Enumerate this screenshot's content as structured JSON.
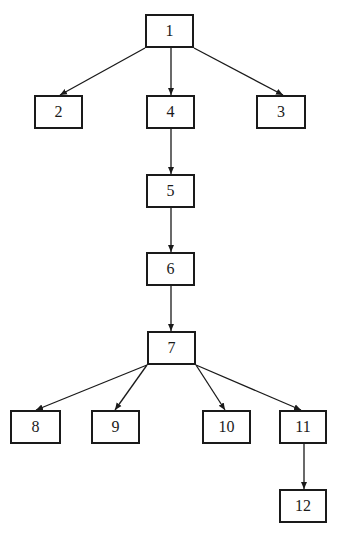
{
  "diagram": {
    "type": "tree",
    "colors": {
      "stroke": "#1a1a1a",
      "background": "#ffffff"
    },
    "nodes": [
      {
        "id": "1",
        "label": "1",
        "x": 145,
        "y": 14,
        "w": 49,
        "h": 34
      },
      {
        "id": "2",
        "label": "2",
        "x": 34,
        "y": 95,
        "w": 49,
        "h": 34
      },
      {
        "id": "4",
        "label": "4",
        "x": 146,
        "y": 95,
        "w": 49,
        "h": 34
      },
      {
        "id": "3",
        "label": "3",
        "x": 256,
        "y": 95,
        "w": 50,
        "h": 34
      },
      {
        "id": "5",
        "label": "5",
        "x": 146,
        "y": 174,
        "w": 49,
        "h": 34
      },
      {
        "id": "6",
        "label": "6",
        "x": 146,
        "y": 252,
        "w": 49,
        "h": 34
      },
      {
        "id": "7",
        "label": "7",
        "x": 147,
        "y": 331,
        "w": 49,
        "h": 34
      },
      {
        "id": "8",
        "label": "8",
        "x": 10,
        "y": 410,
        "w": 51,
        "h": 34
      },
      {
        "id": "9",
        "label": "9",
        "x": 91,
        "y": 410,
        "w": 49,
        "h": 34
      },
      {
        "id": "10",
        "label": "10",
        "x": 202,
        "y": 410,
        "w": 49,
        "h": 34
      },
      {
        "id": "11",
        "label": "11",
        "x": 279,
        "y": 410,
        "w": 48,
        "h": 34
      },
      {
        "id": "12",
        "label": "12",
        "x": 279,
        "y": 489,
        "w": 48,
        "h": 34
      }
    ],
    "edges": [
      {
        "from": "1",
        "to": "2",
        "x1": 145,
        "y1": 48,
        "x2": 60,
        "y2": 95
      },
      {
        "from": "1",
        "to": "4",
        "x1": 171,
        "y1": 48,
        "x2": 171,
        "y2": 95
      },
      {
        "from": "1",
        "to": "3",
        "x1": 194,
        "y1": 48,
        "x2": 283,
        "y2": 95
      },
      {
        "from": "4",
        "to": "5",
        "x1": 171,
        "y1": 129,
        "x2": 171,
        "y2": 174
      },
      {
        "from": "5",
        "to": "6",
        "x1": 171,
        "y1": 208,
        "x2": 171,
        "y2": 252
      },
      {
        "from": "6",
        "to": "7",
        "x1": 171,
        "y1": 286,
        "x2": 171,
        "y2": 331
      },
      {
        "from": "7",
        "to": "8",
        "x1": 147,
        "y1": 365,
        "x2": 36,
        "y2": 410
      },
      {
        "from": "7",
        "to": "9",
        "x1": 147,
        "y1": 365,
        "x2": 115,
        "y2": 410
      },
      {
        "from": "7",
        "to": "10",
        "x1": 196,
        "y1": 365,
        "x2": 225,
        "y2": 410
      },
      {
        "from": "7",
        "to": "11",
        "x1": 196,
        "y1": 365,
        "x2": 301,
        "y2": 410
      },
      {
        "from": "11",
        "to": "12",
        "x1": 304,
        "y1": 444,
        "x2": 304,
        "y2": 489
      }
    ]
  }
}
